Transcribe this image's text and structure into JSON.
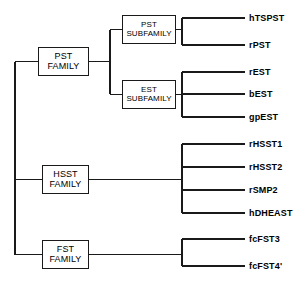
{
  "diagram": {
    "type": "phylogenetic-tree",
    "title": "",
    "orientation": "left-to-right",
    "line_color": "#1a1a1a",
    "background_color": "#ffffff",
    "internal_nodes": [
      {
        "id": "pst-family",
        "line1": "PST",
        "line2": "FAMILY",
        "x": 38,
        "y": 47,
        "width": 51,
        "height": 29,
        "font_size": 9
      },
      {
        "id": "pst-subfamily",
        "line1": "PST",
        "line2": "SUBFAMILY",
        "x": 122,
        "y": 15,
        "width": 54,
        "height": 29,
        "font_size": 8
      },
      {
        "id": "est-subfamily",
        "line1": "EST",
        "line2": "SUBFAMILY",
        "x": 122,
        "y": 80,
        "width": 54,
        "height": 29,
        "font_size": 8
      },
      {
        "id": "hsst-family",
        "line1": "HSST",
        "line2": "FAMILY",
        "x": 42,
        "y": 165,
        "width": 47,
        "height": 29,
        "font_size": 9
      },
      {
        "id": "fst-family",
        "line1": "FST",
        "line2": "FAMILY",
        "x": 42,
        "y": 240,
        "width": 47,
        "height": 29,
        "font_size": 9
      }
    ],
    "leaves": [
      {
        "id": "htspst",
        "label": "hTSPST",
        "y": 18,
        "group": "pst-subfamily"
      },
      {
        "id": "rpst",
        "label": "rPST",
        "y": 45,
        "group": "pst-subfamily"
      },
      {
        "id": "rest",
        "label": "rEST",
        "y": 72,
        "group": "est-subfamily"
      },
      {
        "id": "best",
        "label": "bEST",
        "y": 94,
        "group": "est-subfamily"
      },
      {
        "id": "gpest",
        "label": "gpEST",
        "y": 117,
        "group": "est-subfamily"
      },
      {
        "id": "rhsst1",
        "label": "rHSST1",
        "y": 144,
        "group": "hsst-family"
      },
      {
        "id": "rhsst2",
        "label": "rHSST2",
        "y": 167,
        "group": "hsst-family"
      },
      {
        "id": "rsmp2",
        "label": "rSMP2",
        "y": 190,
        "group": "hsst-family"
      },
      {
        "id": "hdheast",
        "label": "hDHEAST",
        "y": 213,
        "group": "hsst-family"
      },
      {
        "id": "fcfst3",
        "label": "fcFST3",
        "y": 239,
        "group": "fst-family"
      },
      {
        "id": "fcfst4",
        "label": "fcFST4'",
        "y": 266,
        "group": "fst-family"
      }
    ],
    "geometry": {
      "root_trunk_x": 15,
      "root_trunk_top": 62,
      "root_trunk_bottom": 255,
      "root_branch_ys": [
        62,
        180,
        255
      ],
      "pst_split_x": 110,
      "pst_split_top": 30,
      "pst_split_bottom": 94,
      "leaf_tip_x": 245,
      "label_x": 249,
      "leaf_connector_xs": {
        "pst-subfamily": 182,
        "est-subfamily": 182,
        "hsst-family": 182,
        "fst-family": 182
      },
      "leaf_label_font_size": 9
    }
  }
}
